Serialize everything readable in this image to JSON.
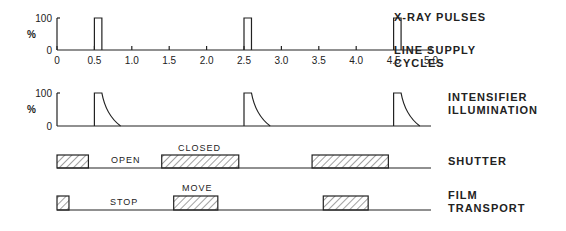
{
  "xaxis": {
    "min": 0,
    "max": 5.0,
    "ticks": [
      "0",
      "0.5",
      "1.0",
      "1.5",
      "2.0",
      "2.5",
      "3.0",
      "3.5",
      "4.0",
      "4.5",
      "5.0"
    ]
  },
  "yaxis": {
    "top_label": "100",
    "bottom_label": "0",
    "unit": "%"
  },
  "labels": {
    "xray": "X-RAY PULSES",
    "line_supply_1": "LINE SUPPLY",
    "line_supply_2": "CYCLES",
    "intens_1": "INTENSIFIER",
    "intens_2": "ILLUMINATION",
    "shutter": "SHUTTER",
    "film_1": "FILM",
    "film_2": "TRANSPORT"
  },
  "states": {
    "open": "OPEN",
    "closed": "CLOSED",
    "stop": "STOP",
    "move": "MOVE"
  },
  "chart_data": [
    {
      "type": "line",
      "title": "X-RAY PULSES",
      "xlabel": "LINE SUPPLY CYCLES",
      "ylabel": "%",
      "ylim": [
        0,
        100
      ],
      "xlim": [
        0,
        5.0
      ],
      "pulses": [
        {
          "start": 0.5,
          "end": 0.6,
          "value": 100
        },
        {
          "start": 2.5,
          "end": 2.6,
          "value": 100
        },
        {
          "start": 4.5,
          "end": 4.6,
          "value": 100
        }
      ]
    },
    {
      "type": "line",
      "title": "INTENSIFIER ILLUMINATION",
      "ylabel": "%",
      "ylim": [
        0,
        100
      ],
      "xlim": [
        0,
        5.0
      ],
      "pulses": [
        {
          "rise": 0.5,
          "plateau_end": 0.6,
          "decay_end": 0.85
        },
        {
          "rise": 2.5,
          "plateau_end": 2.6,
          "decay_end": 2.85
        },
        {
          "rise": 4.5,
          "plateau_end": 4.6,
          "decay_end": 4.85
        }
      ]
    },
    {
      "type": "bar",
      "title": "SHUTTER",
      "high_state": "CLOSED",
      "low_state": "OPEN",
      "intervals": [
        {
          "start": 0,
          "end": 0.42
        },
        {
          "start": 1.4,
          "end": 2.43
        },
        {
          "start": 3.41,
          "end": 4.43
        }
      ]
    },
    {
      "type": "bar",
      "title": "FILM TRANSPORT",
      "high_state": "MOVE",
      "low_state": "STOP",
      "intervals": [
        {
          "start": 0,
          "end": 0.16
        },
        {
          "start": 1.56,
          "end": 2.15
        },
        {
          "start": 3.56,
          "end": 4.16
        }
      ]
    }
  ]
}
